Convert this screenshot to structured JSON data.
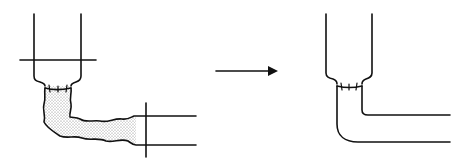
{
  "diagram": {
    "type": "before-after surgical schematic",
    "panels": [
      {
        "id": "before",
        "elements": [
          "vertical tube",
          "horizontal tube",
          "transverse cut line on vertical tube",
          "transverse cut line on horizontal tube",
          "stitched anastomosis",
          "stippled irregular connecting segment"
        ]
      },
      {
        "id": "after",
        "elements": [
          "vertical tube",
          "curved L-shaped tube",
          "stitched anastomosis"
        ]
      }
    ],
    "arrow": {
      "direction": "right"
    },
    "colors": {
      "stroke": "#111111",
      "stipple": "#888888",
      "background": "#ffffff"
    }
  }
}
